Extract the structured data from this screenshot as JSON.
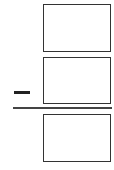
{
  "problem": {
    "operator": "minus",
    "operator_icon": "minus-icon",
    "minuend_value": "",
    "subtrahend_value": "",
    "answer_value": ""
  },
  "colors": {
    "border": "#333333",
    "background": "#ffffff"
  }
}
